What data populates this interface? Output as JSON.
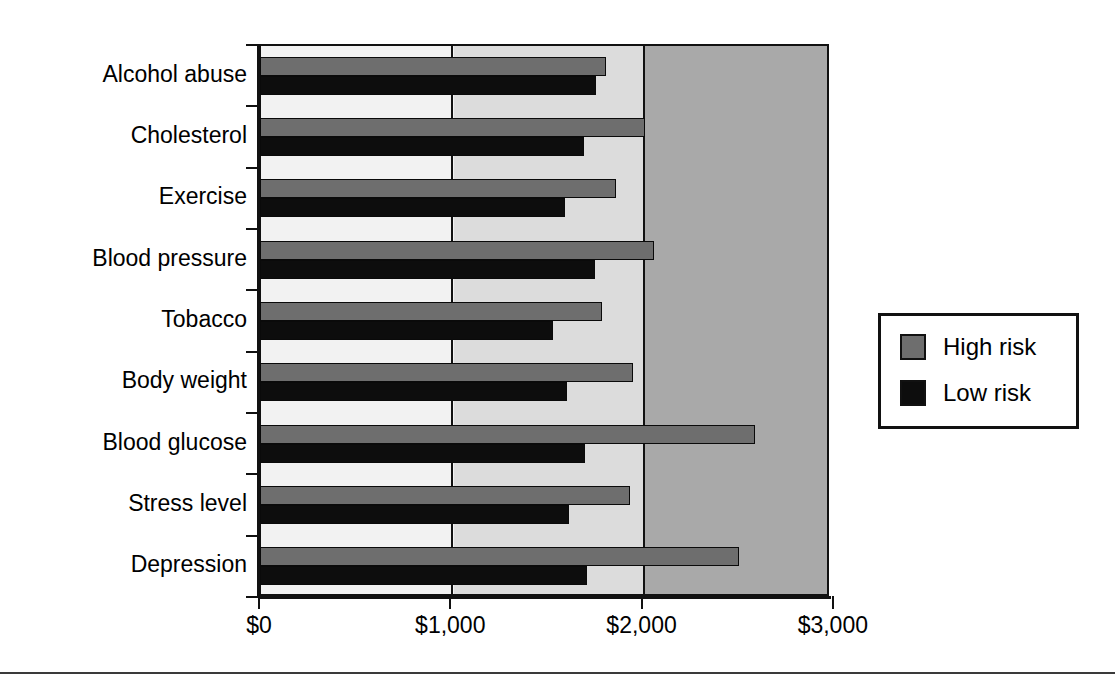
{
  "chart_data": {
    "type": "bar",
    "orientation": "horizontal",
    "title": "",
    "xlabel": "",
    "ylabel": "",
    "categories": [
      "Alcohol abuse",
      "Cholesterol",
      "Exercise",
      "Blood pressure",
      "Tobacco",
      "Body weight",
      "Blood glucose",
      "Stress level",
      "Depression"
    ],
    "series": [
      {
        "name": "High risk",
        "color": "#6e6e6e",
        "values": [
          1805,
          2010,
          1855,
          2055,
          1785,
          1945,
          2585,
          1930,
          2500
        ]
      },
      {
        "name": "Low risk",
        "color": "#0d0d0d",
        "values": [
          1750,
          1690,
          1590,
          1745,
          1525,
          1600,
          1695,
          1610,
          1705
        ]
      }
    ],
    "xlim": [
      0,
      2980
    ],
    "xticks": [
      0,
      1000,
      2000,
      3000
    ],
    "xticklabels": [
      "$0",
      "$1,000",
      "$2,000",
      "$3,000"
    ],
    "grid": true,
    "gridlines_at": [
      1000,
      2000
    ],
    "legend_position": "right-middle",
    "legend_entries": [
      "High risk",
      "Low risk"
    ],
    "plot_background_bands": [
      "#f2f2f2",
      "#dcdcdc",
      "#a9a9a9"
    ]
  }
}
